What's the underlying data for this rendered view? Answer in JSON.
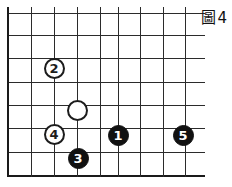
{
  "figure": {
    "caption": "圖4",
    "caption_label": "Figure 4"
  },
  "board": {
    "type": "go-board-corner",
    "stone_diameter_px": 21,
    "grid_spacing_px": 23,
    "origin_x_px": 7,
    "origin_y_px": 13,
    "vertical_lines_x": [
      7,
      31,
      54,
      77,
      100,
      118,
      140,
      163,
      185
    ],
    "horizontal_lines_y": [
      13,
      35,
      58,
      82,
      105,
      128,
      152,
      175
    ],
    "horizontal_line_extent_x": [
      7,
      205
    ],
    "left_edge_x": 7,
    "bottom_edge_y": 175,
    "line_color": "#2b2b2b",
    "edge_color": "#1a1a1a",
    "background_color": "#ffffff"
  },
  "stones": [
    {
      "id": "stone-white-2",
      "label": "2",
      "color": "white",
      "numbered": true,
      "cx": 54,
      "cy": 68
    },
    {
      "id": "stone-white-unmarked",
      "label": "",
      "color": "white",
      "numbered": false,
      "cx": 77,
      "cy": 110
    },
    {
      "id": "stone-white-4",
      "label": "4",
      "color": "white",
      "numbered": true,
      "cx": 54,
      "cy": 134
    },
    {
      "id": "stone-black-3",
      "label": "3",
      "color": "black",
      "numbered": true,
      "cx": 78,
      "cy": 158
    },
    {
      "id": "stone-black-1",
      "label": "1",
      "color": "black",
      "numbered": true,
      "cx": 118,
      "cy": 135
    },
    {
      "id": "stone-black-5",
      "label": "5",
      "color": "black",
      "numbered": true,
      "cx": 183,
      "cy": 135
    }
  ],
  "colors": {
    "black_stone": "#111111",
    "white_stone": "#ffffff",
    "stone_outline": "#1c1c1c",
    "grid": "#2b2b2b",
    "board_edge": "#1a1a1a",
    "caption_text": "#111111"
  }
}
